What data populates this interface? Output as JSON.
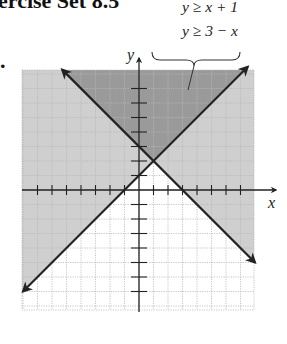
{
  "heading": "ercise Set 8.5",
  "bullet": ".",
  "system": {
    "inequalities": [
      "y ≥ x + 1",
      "y ≥ 3 − x"
    ]
  },
  "axes": {
    "x_label": "x",
    "y_label": "y"
  },
  "colors": {
    "light_shade": "#cfcfcf",
    "dark_shade": "#9a9a9a",
    "line": "#222222",
    "grid": "#b8b8b8"
  },
  "chart_data": {
    "type": "line",
    "title": "",
    "xlabel": "x",
    "ylabel": "y",
    "xlim": [
      -8,
      8
    ],
    "ylim": [
      -8,
      8
    ],
    "grid": true,
    "series": [
      {
        "name": "y = x + 1",
        "slope": 1,
        "intercept": 1,
        "style": "solid",
        "shade": "above"
      },
      {
        "name": "y = 3 - x",
        "slope": -1,
        "intercept": 3,
        "style": "solid",
        "shade": "above"
      }
    ],
    "intersection": [
      1,
      2
    ],
    "solution_region": "y ≥ x + 1 and y ≥ 3 − x (darker overlap region above both lines)",
    "annotations": [
      "y ≥ x + 1",
      "y ≥ 3 − x"
    ]
  }
}
